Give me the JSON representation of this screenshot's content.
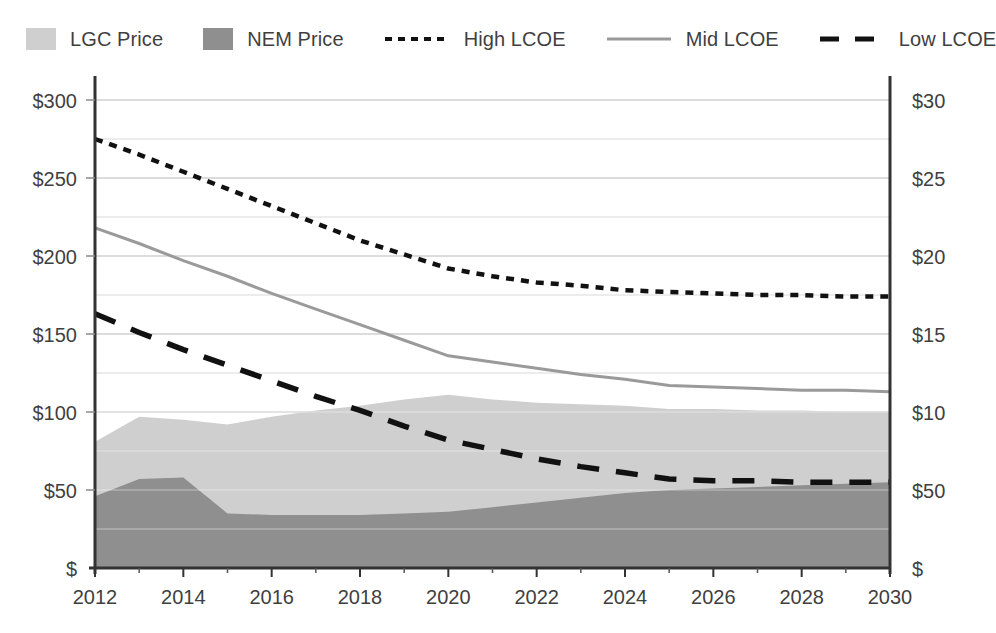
{
  "legend": {
    "items": [
      {
        "label": "LGC Price",
        "type": "area-swatch",
        "color": "#cfcfcf",
        "icon": "square-swatch-icon"
      },
      {
        "label": "NEM Price",
        "type": "area-swatch",
        "color": "#8f8f8f",
        "icon": "square-swatch-icon"
      },
      {
        "label": "High LCOE",
        "type": "dotted-line",
        "color": "#111111",
        "icon": "dotted-line-icon"
      },
      {
        "label": "Mid LCOE",
        "type": "solid-line",
        "color": "#9a9a9a",
        "icon": "solid-line-icon"
      },
      {
        "label": "Low LCOE",
        "type": "dashed-line",
        "color": "#111111",
        "icon": "dashed-line-icon"
      }
    ]
  },
  "axes": {
    "y_ticks": [
      "$",
      "$50",
      "$100",
      "$150",
      "$200",
      "$250",
      "$300"
    ],
    "y_tick_values": [
      0,
      50,
      100,
      150,
      200,
      250,
      300
    ],
    "y_minor_step": 25,
    "x_ticks": [
      "2012",
      "2014",
      "2016",
      "2018",
      "2020",
      "2022",
      "2024",
      "2026",
      "2028",
      "2030"
    ],
    "x_tick_values": [
      2012,
      2014,
      2016,
      2018,
      2020,
      2022,
      2024,
      2026,
      2028,
      2030
    ]
  },
  "chart_data": {
    "type": "area",
    "title": "",
    "subtitle": "",
    "xlabel": "",
    "ylabel": "",
    "xlim": [
      2012,
      2030
    ],
    "ylim": [
      0,
      300
    ],
    "grid": true,
    "legend_position": "top",
    "stacked": true,
    "x": [
      2012,
      2013,
      2014,
      2015,
      2016,
      2017,
      2018,
      2019,
      2020,
      2021,
      2022,
      2023,
      2024,
      2025,
      2026,
      2027,
      2028,
      2029,
      2030
    ],
    "series": [
      {
        "name": "NEM Price",
        "kind": "area",
        "stack": "base",
        "color": "#8f8f8f",
        "values": [
          46,
          57,
          58,
          35,
          34,
          34,
          34,
          35,
          36,
          39,
          42,
          45,
          48,
          50,
          51,
          52,
          53,
          54,
          55
        ]
      },
      {
        "name": "LGC Price",
        "kind": "area",
        "stack": "top",
        "color": "#cfcfcf",
        "note": "values are the stacked total (NEM + LGC)",
        "values": [
          81,
          97,
          95,
          92,
          97,
          101,
          104,
          108,
          111,
          108,
          106,
          105,
          104,
          102,
          102,
          101,
          101,
          100,
          100
        ]
      },
      {
        "name": "High LCOE",
        "kind": "line",
        "style": "dotted",
        "color": "#111111",
        "values": [
          275,
          265,
          254,
          243,
          232,
          221,
          210,
          201,
          192,
          187,
          183,
          181,
          178,
          177,
          176,
          175,
          175,
          174,
          174
        ]
      },
      {
        "name": "Mid LCOE",
        "kind": "line",
        "style": "solid",
        "color": "#9a9a9a",
        "values": [
          218,
          208,
          197,
          187,
          176,
          166,
          156,
          146,
          136,
          132,
          128,
          124,
          121,
          117,
          116,
          115,
          114,
          114,
          113
        ]
      },
      {
        "name": "Low LCOE",
        "kind": "line",
        "style": "dashed",
        "color": "#111111",
        "values": [
          163,
          151,
          140,
          130,
          120,
          110,
          101,
          91,
          82,
          76,
          70,
          65,
          61,
          57,
          56,
          56,
          55,
          55,
          55
        ]
      }
    ]
  }
}
